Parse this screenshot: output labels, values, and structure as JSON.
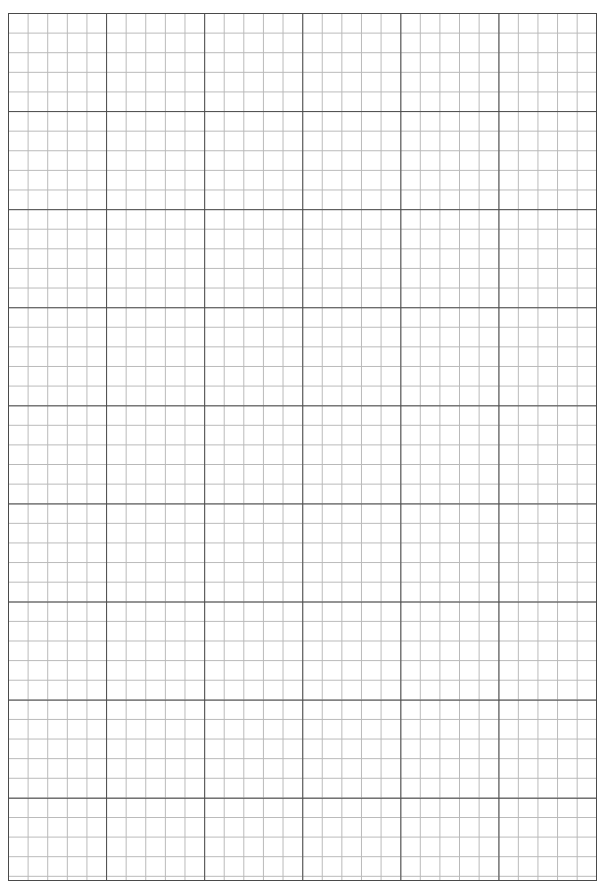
{
  "page": {
    "kind": "grid-paper-sheet",
    "width": 606,
    "height": 886,
    "background_color": "#ffffff"
  },
  "grid": {
    "origin_x": 8,
    "origin_y": 13,
    "width": 589,
    "height": 868,
    "minor_cell_px": 19.62,
    "major_every": 5,
    "minor_line_color": "#b9b9b9",
    "major_line_color": "#4a4a4a",
    "border_color": "#4a4a4a",
    "minor_line_width": 1,
    "major_line_width": 1.4,
    "border_width": 1.6,
    "minor_columns": 30,
    "minor_rows": 44,
    "major_columns": 6,
    "major_rows": 9
  },
  "content": {
    "text_items": [],
    "note": ""
  }
}
